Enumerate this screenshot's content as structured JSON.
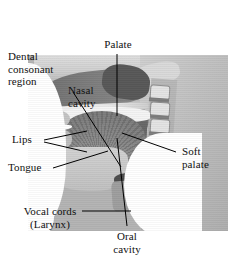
{
  "figure": {
    "type": "sagittal-head-mri-photograph",
    "colors": {
      "background": "#ffffff",
      "label_text": "#111111",
      "leader_line": "#000000",
      "tissue_light": "#d6d6d6",
      "tissue_mid": "#bdbdbd",
      "tissue_dark": "#8a8a8a",
      "cavity_dark": "#5e5e5e"
    }
  },
  "labels": [
    {
      "id": "dental-consonant-region",
      "text": "Dental\nconsonant\nregion",
      "align": "left"
    },
    {
      "id": "palate",
      "text": "Palate",
      "align": "center"
    },
    {
      "id": "nasal-cavity",
      "text": "Nasal\ncavity",
      "align": "left"
    },
    {
      "id": "lips",
      "text": "Lips",
      "align": "left"
    },
    {
      "id": "tongue",
      "text": "Tongue",
      "align": "left"
    },
    {
      "id": "soft-palate",
      "text": "Soft\npalate",
      "align": "left"
    },
    {
      "id": "vocal-cords-larynx",
      "text": "Vocal cords\n(Larynx)",
      "align": "center"
    },
    {
      "id": "oral-cavity",
      "text": "Oral\ncavity",
      "align": "center"
    }
  ],
  "label_text": {
    "dental_consonant_region": "Dental\nconsonant\nregion",
    "palate": "Palate",
    "nasal_cavity": "Nasal\ncavity",
    "lips": "Lips",
    "tongue": "Tongue",
    "soft_palate": "Soft\npalate",
    "vocal_cords": "Vocal cords\n(Larynx)",
    "oral_cavity": "Oral\ncavity"
  }
}
